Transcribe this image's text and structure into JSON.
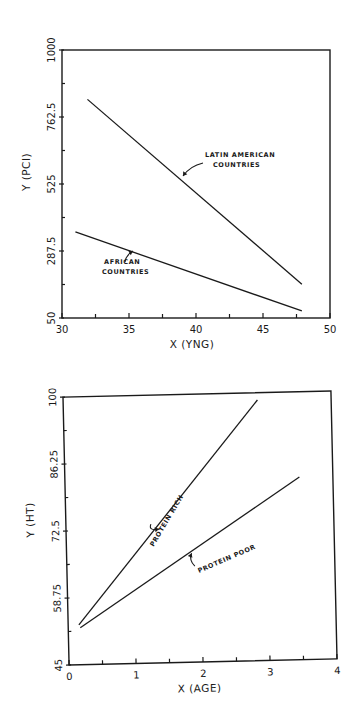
{
  "chart_data": [
    {
      "type": "line",
      "title": "",
      "xlabel": "X (YNG)",
      "ylabel": "Y (PCI)",
      "xlim": [
        30,
        50
      ],
      "ylim": [
        50,
        1000
      ],
      "xticks": [
        30,
        35,
        40,
        45,
        50
      ],
      "xtick_labels": [
        "30",
        "35",
        "40",
        "45",
        "50"
      ],
      "yticks": [
        50,
        287.5,
        525,
        762.5,
        1000
      ],
      "ytick_labels": [
        "50",
        "287.5",
        "525",
        "762.5",
        "1000"
      ],
      "grid": false,
      "series": [
        {
          "name": "Latin American Countries",
          "annotation": [
            "LATIN AMERICAN",
            "COUNTRIES"
          ],
          "x": [
            31.9,
            47.9
          ],
          "y": [
            825,
            170
          ]
        },
        {
          "name": "African Countries",
          "annotation": [
            "AFRICAN",
            "COUNTRIES"
          ],
          "x": [
            31.0,
            47.9
          ],
          "y": [
            355,
            75
          ]
        }
      ]
    },
    {
      "type": "line",
      "title": "",
      "xlabel": "X (AGE)",
      "ylabel": "Y (HT)",
      "xlim": [
        0,
        4
      ],
      "ylim": [
        45,
        100
      ],
      "xticks": [
        0,
        1,
        2,
        3,
        4
      ],
      "xtick_labels": [
        "0",
        "1",
        "2",
        "3",
        "4"
      ],
      "yticks": [
        45,
        58.75,
        72.5,
        86.25,
        100
      ],
      "ytick_labels": [
        "45",
        "58.75",
        "72.5",
        "86.25",
        "100"
      ],
      "grid": false,
      "series": [
        {
          "name": "Protein Rich",
          "annotation": [
            "PROTEIN RICH"
          ],
          "x": [
            0.16,
            2.9
          ],
          "y": [
            53.2,
            98.5
          ]
        },
        {
          "name": "Protein Poor",
          "annotation": [
            "PROTEIN POOR"
          ],
          "x": [
            0.18,
            3.5
          ],
          "y": [
            52.6,
            82.5
          ]
        }
      ]
    }
  ]
}
